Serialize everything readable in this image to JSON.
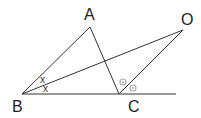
{
  "diagram": {
    "points": {
      "A": {
        "label": "A",
        "x": 90,
        "y": 27
      },
      "B": {
        "label": "B",
        "x": 22,
        "y": 94
      },
      "C": {
        "label": "C",
        "x": 119,
        "y": 94
      },
      "O": {
        "label": "O",
        "x": 183,
        "y": 30
      }
    },
    "segments": [
      "BA",
      "AC",
      "BO",
      "CO",
      "BC-extended"
    ],
    "angle_marks": {
      "B": {
        "symbol": "x",
        "count": 2
      },
      "C_exterior": {
        "symbol": "o",
        "count": 2
      }
    },
    "line_color": "#333333",
    "mark_color": "#999999"
  }
}
